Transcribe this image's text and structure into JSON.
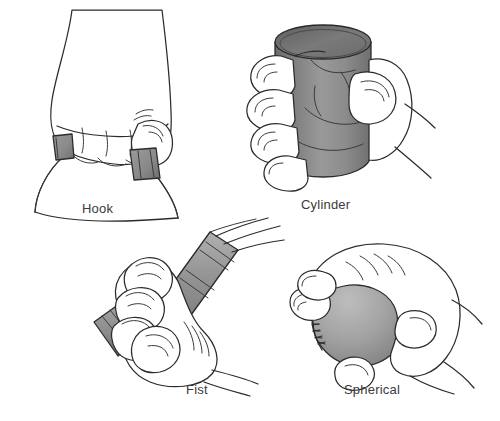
{
  "figure": {
    "background_color": "#ffffff",
    "width": 500,
    "height": 421,
    "style": "black-and-white line drawing with gray shading"
  },
  "palette": {
    "outline": "#2b2b2b",
    "detail_line": "#3a3a3a",
    "label_text": "#3a3a3a",
    "skin_fill": "#ffffff",
    "cylinder_dark": "#6f6f6f",
    "cylinder_mid": "#8d8d8d",
    "cylinder_light": "#a8a8a8",
    "ball_gray": "#a0a0a0",
    "ball_shadow": "#8b8b8b",
    "handle_gray": "#8a8a8a",
    "tool_gray": "#8f8f8f"
  },
  "panels": [
    {
      "id": "hook",
      "label": "Hook",
      "description": "Hand with fingers curled over a bag or bucket handle, carrying by hooking the fingers",
      "object": "carrying handle with straps",
      "label_x": 82,
      "label_y": 202
    },
    {
      "id": "cylinder",
      "label": "Cylinder",
      "description": "Hand wrapped around an upright cylindrical can with thumb opposing the fingers",
      "object": "cylinder / can",
      "label_x": 301,
      "label_y": 198
    },
    {
      "id": "fist",
      "label": "Fist",
      "description": "Hand closed in a fist around the diagonal handle of a long tool",
      "object": "tool handle with tines",
      "label_x": 186,
      "label_y": 383
    },
    {
      "id": "spherical",
      "label": "Spherical",
      "description": "Hand cupped over a ball with the fingers spread around its surface",
      "object": "baseball with stitching",
      "label_x": 344,
      "label_y": 383
    }
  ]
}
